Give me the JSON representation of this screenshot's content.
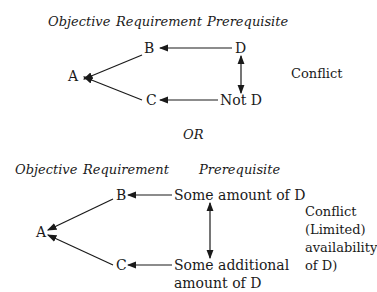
{
  "diagram_top": {
    "headers": {
      "objective": "Objective",
      "requirement": "Requirement",
      "prerequisite": "Prerequisite"
    },
    "nodes": {
      "a": "A",
      "b": "B",
      "c": "C",
      "d": "D",
      "not_d": "Not D"
    },
    "side_label": "Conflict"
  },
  "separator": "OR",
  "diagram_bottom": {
    "headers": {
      "objective": "Objective",
      "requirement": "Requirement",
      "prerequisite": "Prerequisite"
    },
    "nodes": {
      "a": "A",
      "b": "B",
      "c": "C",
      "d1": "Some amount of D",
      "d2_line1": "Some additional",
      "d2_line2": "amount of D"
    },
    "side_label": [
      "Conflict",
      "(Limited)",
      "availability",
      "of D)"
    ]
  }
}
